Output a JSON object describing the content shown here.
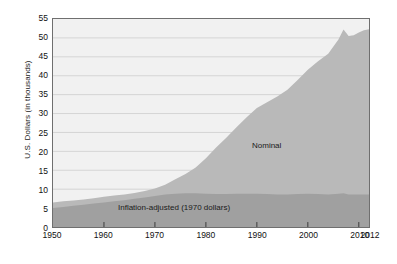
{
  "chart_data": {
    "type": "area",
    "title": "",
    "subtitle": "",
    "xlabel": "",
    "ylabel": "U.S. Dollars (in thousands)",
    "xlim": [
      1950,
      2012
    ],
    "ylim": [
      0,
      55
    ],
    "grid": true,
    "legend_position": "inline-annotations",
    "stacked": false,
    "y_ticks": [
      0,
      5,
      10,
      15,
      20,
      25,
      30,
      35,
      40,
      45,
      50,
      55
    ],
    "x_ticks": [
      1950,
      1960,
      1970,
      1980,
      1990,
      2000,
      2010,
      2012
    ],
    "x_tick_labels": [
      "1950",
      "1960",
      "1970",
      "1980",
      "1990",
      "2000",
      "2010",
      "2012"
    ],
    "colors": {
      "plot_background": "#f1f1f1",
      "gridline": "#d4d4d4",
      "axis": "#6f6f6f",
      "nominal_fill": "#b9b9b9",
      "inflation_fill": "#a0a0a0",
      "text": "#1a1a1a"
    },
    "annotations": [
      {
        "id": "nominal",
        "text": "Nominal",
        "x": 1996,
        "y": 22
      },
      {
        "id": "inflation",
        "text": "Inflation-adjusted (1970 dollars)",
        "x": 1963,
        "y": 6
      }
    ],
    "x": [
      1950,
      1952,
      1954,
      1956,
      1958,
      1960,
      1962,
      1964,
      1966,
      1968,
      1970,
      1972,
      1974,
      1976,
      1978,
      1980,
      1982,
      1984,
      1986,
      1988,
      1990,
      1992,
      1994,
      1996,
      1998,
      2000,
      2002,
      2004,
      2006,
      2007,
      2008,
      2009,
      2010,
      2011,
      2012
    ],
    "series": [
      {
        "name": "Nominal",
        "values": [
          6.5,
          6.8,
          7.0,
          7.3,
          7.6,
          8.0,
          8.3,
          8.6,
          9.0,
          9.5,
          10.2,
          11.2,
          12.6,
          14.0,
          15.7,
          18.2,
          21.0,
          23.6,
          26.4,
          29.0,
          31.5,
          33.0,
          34.5,
          36.3,
          38.9,
          41.6,
          43.8,
          45.8,
          49.6,
          52.2,
          50.5,
          50.7,
          51.4,
          52.0,
          52.3
        ]
      },
      {
        "name": "Inflation-adjusted (1970 dollars)",
        "values": [
          5.0,
          5.3,
          5.6,
          5.9,
          6.2,
          6.5,
          6.8,
          7.1,
          7.5,
          7.8,
          8.2,
          8.6,
          8.8,
          8.9,
          8.9,
          8.8,
          8.7,
          8.7,
          8.8,
          8.8,
          8.8,
          8.7,
          8.6,
          8.6,
          8.7,
          8.8,
          8.7,
          8.6,
          8.8,
          8.9,
          8.6,
          8.6,
          8.6,
          8.6,
          8.6
        ]
      }
    ]
  }
}
